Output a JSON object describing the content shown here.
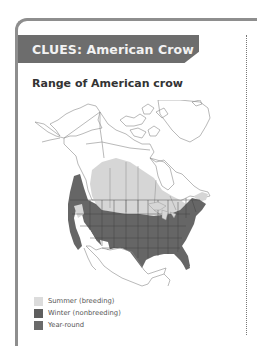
{
  "card": {
    "banner_title": "CLUES: American Crow",
    "subtitle": "Range of American crow"
  },
  "map": {
    "region": "North America",
    "colors": {
      "land": "#ffffff",
      "outline": "#8a8a8a",
      "summer_breeding": "#d6d6d6",
      "winter_nonbreeding": "#5e5e5e",
      "year_round": "#6a6a6a"
    }
  },
  "legend": {
    "items": [
      {
        "label": "Summer (breeding)",
        "color": "#dcdcdc"
      },
      {
        "label": "Winter (nonbreeding)",
        "color": "#5e5e5e"
      },
      {
        "label": "Year-round",
        "color": "#6a6a6a"
      }
    ]
  },
  "colors": {
    "banner_bg": "#6d6d6d",
    "banner_text": "#f2f2f2",
    "card_border": "#8e8e8e",
    "subtitle_text": "#333333"
  }
}
